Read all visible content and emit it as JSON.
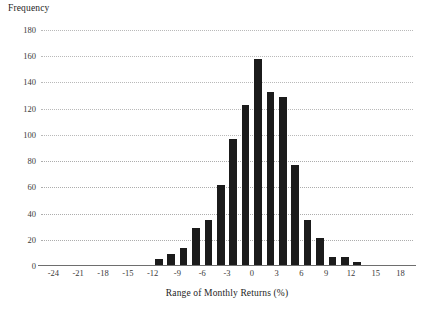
{
  "chart_data": {
    "type": "bar",
    "title": "",
    "xlabel": "Range of Monthly Returns (%)",
    "ylabel": "Frequency",
    "xlim": [
      -25.5,
      19.5
    ],
    "ylim": [
      0,
      180
    ],
    "grid": true,
    "legend_position": "none",
    "bin_width": 1.5,
    "y_ticks": [
      180,
      160,
      140,
      120,
      100,
      80,
      60,
      40,
      20,
      0
    ],
    "y_tick_labels": [
      "180",
      "160",
      "140",
      "120",
      "100",
      "80",
      "60",
      "40",
      "20",
      "0"
    ],
    "x_ticks": [
      -24,
      -21,
      -18,
      -15,
      -12,
      -9,
      -6,
      -3,
      0,
      3,
      6,
      9,
      12,
      15,
      18
    ],
    "x_tick_labels": [
      "-24",
      "-21",
      "-18",
      "-15",
      "-12",
      "-9",
      "-6",
      "-3",
      "0",
      "3",
      "6",
      "9",
      "12",
      "15",
      "18"
    ],
    "bar_color": "#1b1b1b",
    "gridline_color": "#b9b9b9",
    "axis_color": "#6e6e6e",
    "x": [
      -24.75,
      -23.25,
      -21.75,
      -20.25,
      -18.75,
      -17.25,
      -15.75,
      -14.25,
      -12.75,
      -11.25,
      -9.75,
      -8.25,
      -6.75,
      -5.25,
      -3.75,
      -2.25,
      -0.75,
      0.75,
      2.25,
      3.75,
      5.25,
      6.75,
      8.25,
      9.75,
      11.25,
      12.75,
      14.25,
      15.75,
      17.25
    ],
    "categories": [
      "-25.5 to -24",
      "-24 to -22.5",
      "-22.5 to -21",
      "-21 to -19.5",
      "-19.5 to -18",
      "-18 to -16.5",
      "-16.5 to -15",
      "-15 to -13.5",
      "-13.5 to -12",
      "-12 to -10.5",
      "-10.5 to -9",
      "-9 to -7.5",
      "-7.5 to -6",
      "-6 to -4.5",
      "-4.5 to -3",
      "-3 to -1.5",
      "-1.5 to 0",
      "0 to 1.5",
      "1.5 to 3",
      "3 to 4.5",
      "4.5 to 6",
      "6 to 7.5",
      "7.5 to 9",
      "9 to 10.5",
      "10.5 to 12",
      "12 to 13.5",
      "13.5 to 15",
      "15 to 16.5",
      "16.5 to 18"
    ],
    "values": [
      0,
      1,
      1,
      0,
      0,
      1,
      0,
      1,
      0,
      5,
      9,
      14,
      29,
      35,
      62,
      97,
      123,
      158,
      133,
      129,
      77,
      35,
      21,
      7,
      7,
      3,
      0,
      1,
      0
    ],
    "series": [
      {
        "name": "Frequency",
        "values": [
          0,
          1,
          1,
          0,
          0,
          1,
          0,
          1,
          0,
          5,
          9,
          14,
          29,
          35,
          62,
          97,
          123,
          158,
          133,
          129,
          77,
          35,
          21,
          7,
          7,
          3,
          0,
          1,
          0
        ]
      }
    ]
  }
}
